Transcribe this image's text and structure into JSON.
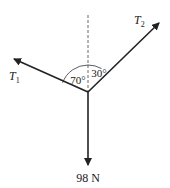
{
  "diagram": {
    "type": "free-body force diagram",
    "colors": {
      "line": "#222222",
      "dashed": "#555555",
      "background": "#ffffff"
    },
    "vertical_reference": {
      "style": "dashed"
    },
    "forces": [
      {
        "id": "T1",
        "label_main": "T",
        "label_sub": "1",
        "angle_from_vertical_deg": 70,
        "direction": "upper-left"
      },
      {
        "id": "T2",
        "label_main": "T",
        "label_sub": "2",
        "angle_from_vertical_deg": 30,
        "direction": "upper-right"
      },
      {
        "id": "W",
        "label": "98 N",
        "direction": "down"
      }
    ],
    "angles": [
      {
        "label": "70°",
        "between": [
          "vertical",
          "T1"
        ]
      },
      {
        "label": "30°",
        "between": [
          "vertical",
          "T2"
        ]
      }
    ]
  },
  "labels": {
    "t1_main": "T",
    "t1_sub": "1",
    "t2_main": "T",
    "t2_sub": "2",
    "weight": "98 N",
    "angle_left": "70°",
    "angle_right": "30°"
  }
}
